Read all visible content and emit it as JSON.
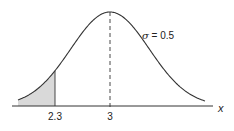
{
  "chart_data": {
    "type": "area",
    "title": "",
    "subtitle": "Normal distribution with shaded left tail",
    "xlabel": "x",
    "ylabel": "",
    "distribution": "normal",
    "mean": 3,
    "sigma": 0.5,
    "sigma_label": "σ = 0.5",
    "shaded_region": {
      "from": "-inf",
      "to": 2.3
    },
    "x_ticks": [
      {
        "value": 2.3,
        "label": "2.3"
      },
      {
        "value": 3,
        "label": "3"
      }
    ],
    "xlim": [
      1.5,
      4.6
    ],
    "mean_line": "dashed",
    "grid": false,
    "legend": "none",
    "colors": {
      "curve": "#333333",
      "shade": "#d9d9d9",
      "axis": "#333333"
    }
  }
}
